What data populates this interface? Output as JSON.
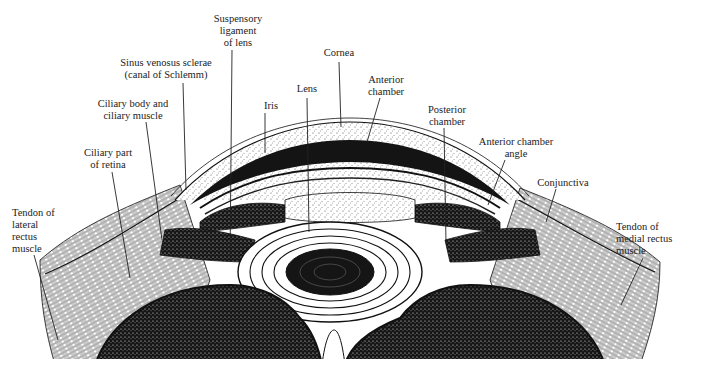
{
  "diagram": {
    "colors": {
      "ink": "#111111",
      "paper": "#ffffff",
      "text": "#222222"
    },
    "labels": [
      {
        "id": "suspensory-ligament",
        "text": "Suspensory\nligament\nof lens",
        "x": 208,
        "y": 13,
        "w": 60,
        "align": "center"
      },
      {
        "id": "cornea",
        "text": "Cornea",
        "x": 316,
        "y": 47,
        "w": 46,
        "align": "center"
      },
      {
        "id": "sinus-venosus",
        "text": "Sinus venosus sclerae\n(canal of Schlemm)",
        "x": 108,
        "y": 57,
        "w": 116,
        "align": "center"
      },
      {
        "id": "lens",
        "text": "Lens",
        "x": 291,
        "y": 83,
        "w": 32,
        "align": "center"
      },
      {
        "id": "anterior-chamber",
        "text": "Anterior\nchamber",
        "x": 361,
        "y": 74,
        "w": 50,
        "align": "center"
      },
      {
        "id": "ciliary-body",
        "text": "Ciliary body and\nciliary muscle",
        "x": 90,
        "y": 98,
        "w": 86,
        "align": "center"
      },
      {
        "id": "iris",
        "text": "Iris",
        "x": 256,
        "y": 100,
        "w": 30,
        "align": "center"
      },
      {
        "id": "posterior-chamber",
        "text": "Posterior\nchamber",
        "x": 420,
        "y": 104,
        "w": 54,
        "align": "center"
      },
      {
        "id": "ciliary-retina",
        "text": "Ciliary part\nof retina",
        "x": 76,
        "y": 147,
        "w": 64,
        "align": "center"
      },
      {
        "id": "anterior-chamber-angle",
        "text": "Anterior chamber\nangle",
        "x": 468,
        "y": 136,
        "w": 96,
        "align": "center"
      },
      {
        "id": "conjunctiva",
        "text": "Conjunctiva",
        "x": 530,
        "y": 177,
        "w": 66,
        "align": "center"
      },
      {
        "id": "tendon-lateral",
        "text": "Tendon of\nlateral\nrectus\nmuscle",
        "x": 12,
        "y": 207,
        "w": 60,
        "align": "left"
      },
      {
        "id": "tendon-medial",
        "text": "Tendon of\nmedial rectus\nmuscle",
        "x": 616,
        "y": 221,
        "w": 80,
        "align": "left"
      }
    ],
    "leaders": [
      {
        "id": "suspensory-ligament",
        "x1": 232,
        "y1": 50,
        "x2": 230,
        "y2": 262
      },
      {
        "id": "cornea",
        "x1": 339,
        "y1": 62,
        "x2": 341,
        "y2": 127
      },
      {
        "id": "sinus-venosus",
        "x1": 183,
        "y1": 83,
        "x2": 186,
        "y2": 190
      },
      {
        "id": "lens",
        "x1": 307,
        "y1": 98,
        "x2": 309,
        "y2": 232
      },
      {
        "id": "anterior-chamber",
        "x1": 380,
        "y1": 98,
        "x2": 367,
        "y2": 142
      },
      {
        "id": "ciliary-body",
        "x1": 146,
        "y1": 122,
        "x2": 162,
        "y2": 240
      },
      {
        "id": "iris",
        "x1": 265,
        "y1": 113,
        "x2": 265,
        "y2": 153
      },
      {
        "id": "posterior-chamber",
        "x1": 444,
        "y1": 128,
        "x2": 446,
        "y2": 243
      },
      {
        "id": "ciliary-retina",
        "x1": 112,
        "y1": 172,
        "x2": 130,
        "y2": 278
      },
      {
        "id": "anterior-chamber-angle",
        "x1": 505,
        "y1": 160,
        "x2": 488,
        "y2": 205
      },
      {
        "id": "conjunctiva",
        "x1": 556,
        "y1": 189,
        "x2": 546,
        "y2": 222
      },
      {
        "id": "tendon-lateral",
        "x1": 34,
        "y1": 255,
        "x2": 58,
        "y2": 340
      },
      {
        "id": "tendon-medial",
        "x1": 643,
        "y1": 258,
        "x2": 621,
        "y2": 305
      }
    ]
  }
}
